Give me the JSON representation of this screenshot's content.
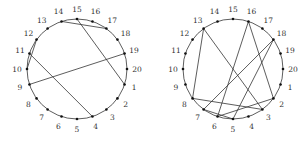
{
  "diagrams": [
    {
      "name": "left-chord-diagram",
      "center": [
        77,
        69
      ],
      "radius": 50,
      "labels": [
        "1",
        "2",
        "3",
        "4",
        "5",
        "6",
        "7",
        "8",
        "9",
        "10",
        "11",
        "12",
        "13",
        "14",
        "15",
        "16",
        "17",
        "18",
        "19",
        "20"
      ],
      "chords": [
        [
          10,
          12
        ],
        [
          11,
          4
        ],
        [
          14,
          17
        ],
        [
          15,
          1
        ],
        [
          19,
          9
        ]
      ]
    },
    {
      "name": "right-chord-diagram",
      "center": [
        233,
        69
      ],
      "radius": 50,
      "labels": [
        "1",
        "2",
        "3",
        "4",
        "5",
        "6",
        "7",
        "8",
        "9",
        "10",
        "11",
        "12",
        "13",
        "14",
        "15",
        "16",
        "17",
        "18",
        "19",
        "20"
      ],
      "chords": [
        [
          13,
          8
        ],
        [
          13,
          3
        ],
        [
          16,
          6
        ],
        [
          16,
          2
        ],
        [
          18,
          7
        ],
        [
          18,
          5
        ],
        [
          8,
          3
        ],
        [
          7,
          5
        ],
        [
          6,
          2
        ]
      ]
    }
  ],
  "colors": {
    "line": "#333333",
    "dot": "#111111",
    "label": "#333333"
  }
}
